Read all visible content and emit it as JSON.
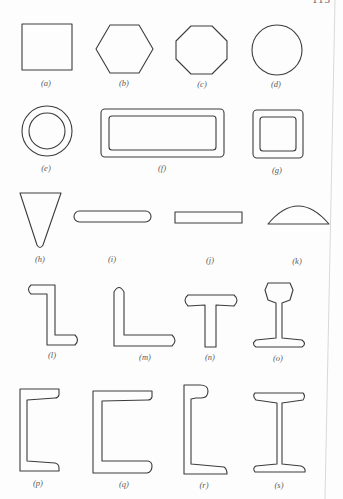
{
  "page": {
    "page_number": "113",
    "stroke_color": "#3c3c3c",
    "label_color": "#5a5a5a",
    "edge_color": "#d8d8d8"
  },
  "figure": {
    "shapes": [
      {
        "id": "a",
        "label": "(a)",
        "name": "square-section"
      },
      {
        "id": "b",
        "label": "(b)",
        "name": "hexagon-section"
      },
      {
        "id": "c",
        "label": "(c)",
        "name": "octagon-section"
      },
      {
        "id": "d",
        "label": "(d)",
        "name": "round-section"
      },
      {
        "id": "e",
        "label": "(e)",
        "name": "round-tube-section"
      },
      {
        "id": "f",
        "label": "(f)",
        "name": "rectangular-tube-section"
      },
      {
        "id": "g",
        "label": "(g)",
        "name": "square-tube-section"
      },
      {
        "id": "h",
        "label": "(h)",
        "name": "wedge-section"
      },
      {
        "id": "i",
        "label": "(i)",
        "name": "rounded-flat-section"
      },
      {
        "id": "j",
        "label": "(j)",
        "name": "flat-bar-section"
      },
      {
        "id": "k",
        "label": "(k)",
        "name": "half-round-section"
      },
      {
        "id": "l",
        "label": "(l)",
        "name": "z-section"
      },
      {
        "id": "m",
        "label": "(m)",
        "name": "angle-section"
      },
      {
        "id": "n",
        "label": "(n)",
        "name": "tee-section"
      },
      {
        "id": "o",
        "label": "(o)",
        "name": "rail-section"
      },
      {
        "id": "p",
        "label": "(p)",
        "name": "channel-section-narrow"
      },
      {
        "id": "q",
        "label": "(q)",
        "name": "channel-section-wide"
      },
      {
        "id": "r",
        "label": "(r)",
        "name": "bulb-channel-section"
      },
      {
        "id": "s",
        "label": "(s)",
        "name": "i-beam-section"
      }
    ]
  }
}
